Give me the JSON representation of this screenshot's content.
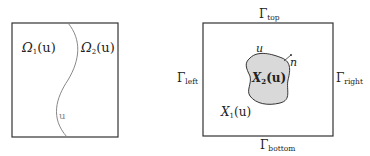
{
  "left_panel": {
    "omega1": {
      "sym": "Ω",
      "sub": "1",
      "arg": "(u)"
    },
    "omega2": {
      "sym": "Ω",
      "sub": "2",
      "arg": "(u)"
    },
    "interface_label": "u"
  },
  "right_panel": {
    "gamma_top": {
      "sym": "Γ",
      "sub": "top"
    },
    "gamma_bottom": {
      "sym": "Γ",
      "sub": "bottom"
    },
    "gamma_left": {
      "sym": "Γ",
      "sub": "left"
    },
    "gamma_right": {
      "sym": "Γ",
      "sub": "right"
    },
    "x1": {
      "sym": "X",
      "sub": "1",
      "arg": "(u)"
    },
    "x2": {
      "sym": "X",
      "sub": "2",
      "arg": "(u)"
    },
    "boundary_label": "u",
    "normal_label": "n"
  },
  "colors": {
    "stroke": "#333333",
    "curve": "#888888",
    "blob_fill": "#d9d9d9"
  }
}
